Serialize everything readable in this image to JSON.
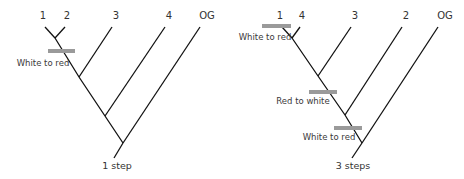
{
  "trees": [
    {
      "id": "tree-left",
      "tips": [
        {
          "label": "1",
          "x": 43,
          "y": 19,
          "tip": [
            45,
            27
          ],
          "node": [
            55,
            38
          ]
        },
        {
          "label": "2",
          "x": 67,
          "y": 19,
          "tip": [
            65,
            27
          ],
          "node": [
            55,
            38
          ]
        },
        {
          "label": "3",
          "x": 116,
          "y": 19,
          "tip": [
            112,
            27
          ],
          "node": [
            79,
            77
          ]
        },
        {
          "label": "4",
          "x": 169,
          "y": 19,
          "tip": [
            165,
            27
          ],
          "node": [
            105,
            116
          ]
        },
        {
          "label": "OG",
          "x": 207,
          "y": 19,
          "tip": [
            200,
            27
          ],
          "node": [
            123,
            143
          ]
        }
      ],
      "spine": [
        [
          55,
          38
        ],
        [
          79,
          77
        ],
        [
          105,
          116
        ],
        [
          123,
          143
        ]
      ],
      "stem": [
        [
          123,
          143
        ],
        [
          114,
          158
        ]
      ],
      "events": [
        {
          "label": "White to red",
          "bar": [
            48,
            51,
            75,
            51
          ],
          "tx": 43,
          "ty": 66
        }
      ],
      "steps_label": "1 step",
      "steps_x": 117,
      "steps_y": 169
    },
    {
      "id": "tree-right",
      "tips": [
        {
          "label": "1",
          "x": 280,
          "y": 19,
          "tip": [
            282,
            27
          ],
          "node": [
            292,
            38
          ]
        },
        {
          "label": "4",
          "x": 302,
          "y": 19,
          "tip": [
            300,
            27
          ],
          "node": [
            292,
            38
          ]
        },
        {
          "label": "3",
          "x": 355,
          "y": 19,
          "tip": [
            351,
            27
          ],
          "node": [
            318,
            76
          ]
        },
        {
          "label": "2",
          "x": 406,
          "y": 19,
          "tip": [
            402,
            27
          ],
          "node": [
            345,
            115
          ]
        },
        {
          "label": "OG",
          "x": 445,
          "y": 19,
          "tip": [
            438,
            27
          ],
          "node": [
            362,
            143
          ]
        }
      ],
      "spine": [
        [
          292,
          38
        ],
        [
          318,
          76
        ],
        [
          345,
          115
        ],
        [
          362,
          143
        ]
      ],
      "stem": [
        [
          362,
          143
        ],
        [
          352,
          158
        ]
      ],
      "events": [
        {
          "label": "White to red",
          "bar": [
            262,
            26,
            291,
            26
          ],
          "tx": 265,
          "ty": 40
        },
        {
          "label": "Red to white",
          "bar": [
            309,
            92,
            337,
            92
          ],
          "tx": 303,
          "ty": 104
        },
        {
          "label": "White to red",
          "bar": [
            334,
            128,
            362,
            128
          ],
          "tx": 329,
          "ty": 140
        }
      ],
      "steps_label": "3 steps",
      "steps_x": 353,
      "steps_y": 169
    }
  ],
  "colors": {
    "branch": "#111111",
    "bar": "#9a9a9a",
    "text": "#333333"
  }
}
